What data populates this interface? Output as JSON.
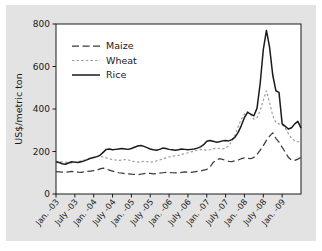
{
  "chart_data": {
    "type": "line",
    "title": "",
    "xlabel": "",
    "ylabel": "US$/metric ton",
    "ylim": [
      0,
      800
    ],
    "yticks": [
      0,
      200,
      400,
      600,
      800
    ],
    "grid": false,
    "legend_position": "top-left",
    "xtick_labels": [
      "Jan. -03",
      "July -03",
      "Jan. -04",
      "July -04",
      "Jan. -05",
      "July -05",
      "Jan. -06",
      "July -06",
      "Jan. -07",
      "July -07",
      "Jan. -08",
      "July -08",
      "Jan. -09"
    ],
    "x_start": "Jan. -03",
    "x_end": "July -09",
    "x_index_count": 79,
    "series": [
      {
        "name": "Maize",
        "style": "long-dash",
        "color": "#3a3a3a",
        "values": [
          105,
          104,
          103,
          102,
          104,
          106,
          105,
          103,
          102,
          104,
          106,
          108,
          110,
          112,
          118,
          122,
          118,
          112,
          108,
          104,
          100,
          98,
          96,
          95,
          93,
          92,
          91,
          93,
          96,
          98,
          97,
          95,
          96,
          98,
          100,
          102,
          101,
          100,
          99,
          100,
          102,
          104,
          103,
          102,
          104,
          106,
          108,
          112,
          116,
          126,
          148,
          160,
          166,
          163,
          158,
          154,
          152,
          156,
          160,
          166,
          170,
          168,
          166,
          172,
          186,
          206,
          228,
          252,
          272,
          288,
          262,
          244,
          220,
          196,
          172,
          160,
          158,
          164,
          172
        ]
      },
      {
        "name": "Wheat",
        "style": "dotted",
        "color": "#9b9b9b",
        "values": [
          148,
          150,
          152,
          150,
          148,
          146,
          148,
          152,
          156,
          160,
          164,
          168,
          172,
          176,
          178,
          174,
          170,
          166,
          162,
          160,
          158,
          160,
          162,
          160,
          156,
          152,
          150,
          152,
          154,
          152,
          150,
          152,
          156,
          160,
          166,
          170,
          174,
          178,
          180,
          182,
          186,
          190,
          194,
          198,
          202,
          206,
          210,
          208,
          206,
          208,
          212,
          216,
          214,
          212,
          216,
          228,
          248,
          278,
          318,
          352,
          376,
          388,
          372,
          352,
          360,
          392,
          442,
          486,
          430,
          370,
          336,
          330,
          326,
          310,
          284,
          262,
          250,
          246,
          245
        ]
      },
      {
        "name": "Rice",
        "style": "solid",
        "color": "#1a1a1a",
        "values": [
          152,
          148,
          142,
          140,
          146,
          152,
          150,
          148,
          152,
          156,
          162,
          168,
          172,
          176,
          182,
          196,
          210,
          212,
          208,
          210,
          212,
          214,
          212,
          210,
          214,
          220,
          226,
          228,
          224,
          218,
          212,
          208,
          206,
          210,
          216,
          214,
          210,
          208,
          206,
          208,
          212,
          210,
          208,
          210,
          212,
          216,
          222,
          232,
          248,
          252,
          248,
          244,
          246,
          250,
          252,
          250,
          256,
          268,
          290,
          322,
          360,
          384,
          376,
          368,
          404,
          520,
          680,
          770,
          690,
          560,
          486,
          478,
          330,
          318,
          306,
          312,
          330,
          342,
          310
        ]
      }
    ]
  },
  "legend": {
    "items": [
      {
        "label": "Maize"
      },
      {
        "label": "Wheat"
      },
      {
        "label": "Rice"
      }
    ]
  },
  "axis": {
    "y_title": "US$/metric ton"
  }
}
